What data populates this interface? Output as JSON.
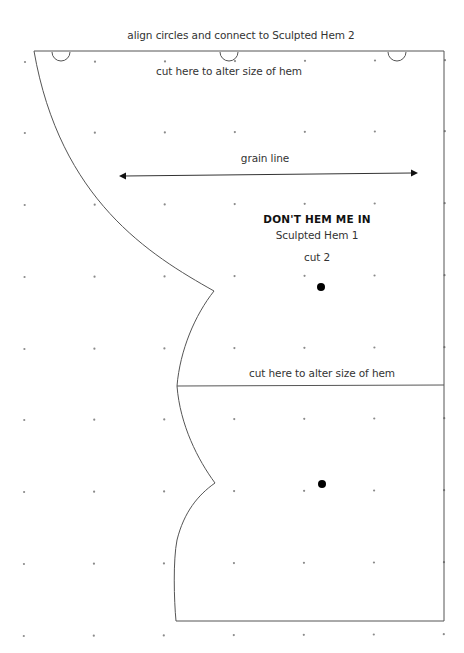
{
  "pattern": {
    "top_instruction": "align circles and connect to Sculpted Hem 2",
    "cut_line_top": "cut here to alter size of hem",
    "grain_line": "grain line",
    "title": "DON'T HEM ME IN",
    "subtitle": "Sculpted Hem 1",
    "cut_count": "cut 2",
    "cut_line_middle": "cut here to alter size of hem"
  },
  "grid": {
    "columns_x": [
      25,
      95,
      165,
      235,
      305,
      375,
      445
    ],
    "rows_y": [
      62,
      133,
      205,
      277,
      349,
      420,
      492,
      564,
      636
    ],
    "dot_color": "#8a8a8a"
  },
  "markers": {
    "semicircles_x": [
      61,
      229,
      397
    ],
    "dots": [
      [
        321,
        287
      ],
      [
        322,
        484
      ]
    ]
  },
  "colors": {
    "outline": "#555555",
    "text": "#333333",
    "background": "#ffffff"
  }
}
